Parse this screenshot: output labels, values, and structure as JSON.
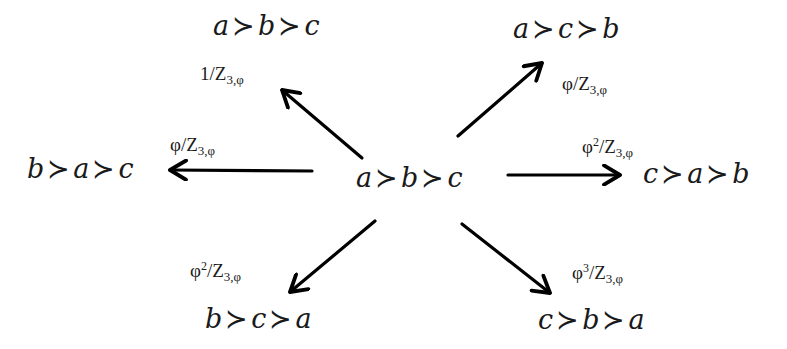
{
  "diagram": {
    "colors": {
      "background": "#ffffff",
      "ink": "#1a1a1a",
      "arrow": "#000000"
    },
    "center": {
      "ranking": [
        "a",
        "b",
        "c"
      ],
      "parts": {
        "x1": "a",
        "op1": "≻",
        "x2": "b",
        "op2": "≻",
        "x3": "c"
      }
    },
    "targets": [
      {
        "id": "top-left",
        "ranking": [
          "a",
          "b",
          "c"
        ],
        "parts": {
          "x1": "a",
          "op1": "≻",
          "x2": "b",
          "op2": "≻",
          "x3": "c"
        },
        "weight": {
          "numerator": "1",
          "power": "",
          "slash": "/",
          "denominator": "Z",
          "subscript": "3,φ"
        }
      },
      {
        "id": "top-right",
        "ranking": [
          "a",
          "c",
          "b"
        ],
        "parts": {
          "x1": "a",
          "op1": "≻",
          "x2": "c",
          "op2": "≻",
          "x3": "b"
        },
        "weight": {
          "numerator": "φ",
          "power": "",
          "slash": "/",
          "denominator": "Z",
          "subscript": "3,φ"
        }
      },
      {
        "id": "left",
        "ranking": [
          "b",
          "a",
          "c"
        ],
        "parts": {
          "x1": "b",
          "op1": "≻",
          "x2": "a",
          "op2": "≻",
          "x3": "c"
        },
        "weight": {
          "numerator": "φ",
          "power": "",
          "slash": "/",
          "denominator": "Z",
          "subscript": "3,φ"
        }
      },
      {
        "id": "right",
        "ranking": [
          "c",
          "a",
          "b"
        ],
        "parts": {
          "x1": "c",
          "op1": "≻",
          "x2": "a",
          "op2": "≻",
          "x3": "b"
        },
        "weight": {
          "numerator": "φ",
          "power": "2",
          "slash": "/",
          "denominator": "Z",
          "subscript": "3,φ"
        }
      },
      {
        "id": "bottom-left",
        "ranking": [
          "b",
          "c",
          "a"
        ],
        "parts": {
          "x1": "b",
          "op1": "≻",
          "x2": "c",
          "op2": "≻",
          "x3": "a"
        },
        "weight": {
          "numerator": "φ",
          "power": "2",
          "slash": "/",
          "denominator": "Z",
          "subscript": "3,φ"
        }
      },
      {
        "id": "bottom-right",
        "ranking": [
          "c",
          "b",
          "a"
        ],
        "parts": {
          "x1": "c",
          "op1": "≻",
          "x2": "b",
          "op2": "≻",
          "x3": "a"
        },
        "weight": {
          "numerator": "φ",
          "power": "3",
          "slash": "/",
          "denominator": "Z",
          "subscript": "3,φ"
        }
      }
    ],
    "arrows": [
      {
        "to": "top-left",
        "from_xy": [
          362,
          158
        ],
        "to_xy": [
          282,
          90
        ]
      },
      {
        "to": "top-right",
        "from_xy": [
          458,
          136
        ],
        "to_xy": [
          542,
          63
        ]
      },
      {
        "to": "left",
        "from_xy": [
          312,
          171
        ],
        "to_xy": [
          170,
          170
        ]
      },
      {
        "to": "right",
        "from_xy": [
          508,
          175
        ],
        "to_xy": [
          620,
          175
        ]
      },
      {
        "to": "bottom-left",
        "from_xy": [
          375,
          221
        ],
        "to_xy": [
          290,
          292
        ]
      },
      {
        "to": "bottom-right",
        "from_xy": [
          462,
          224
        ],
        "to_xy": [
          550,
          293
        ]
      }
    ]
  }
}
